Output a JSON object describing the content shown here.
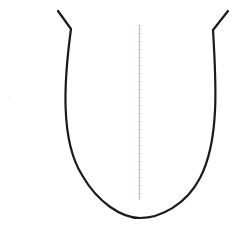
{
  "diagram": {
    "title": "",
    "shape": "tongue-outline",
    "outline_color": "#1a1a1a",
    "midline_color": "#7fa3a8",
    "background": "#ffffff",
    "elements": [
      {
        "name": "tongue-outline",
        "type": "path"
      },
      {
        "name": "median-line",
        "type": "line"
      }
    ]
  }
}
